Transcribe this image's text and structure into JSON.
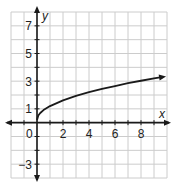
{
  "chart_data": {
    "type": "line",
    "title": "",
    "xlabel": "x",
    "ylabel": "y",
    "xlim": [
      -2,
      10
    ],
    "ylim": [
      -4,
      8
    ],
    "grid": true,
    "x_ticks": [
      2,
      4,
      6,
      8
    ],
    "y_ticks": [
      -3,
      1,
      3,
      5,
      7
    ],
    "origin_label": "0",
    "series": [
      {
        "name": "y = sqrt(x) + 0.2",
        "x": [
          0,
          0.1,
          0.25,
          0.5,
          1,
          2,
          3,
          4,
          5,
          6,
          7,
          8,
          9,
          9.7
        ],
        "y": [
          0.2,
          0.52,
          0.7,
          0.91,
          1.2,
          1.61,
          1.93,
          2.2,
          2.44,
          2.65,
          2.85,
          3.03,
          3.2,
          3.31
        ],
        "arrow_end": true
      }
    ],
    "colors": {
      "grid": "#cccccc",
      "axis": "#1a1a1a",
      "curve": "#1a1a1a"
    }
  }
}
